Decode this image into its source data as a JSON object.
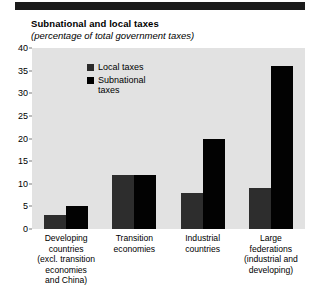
{
  "header": {
    "rule": "black-horizontal-rule"
  },
  "chart_data": {
    "type": "bar",
    "title": "Subnational and local taxes",
    "subtitle": "(percentage of  total government taxes)",
    "xlabel": "",
    "ylabel": "",
    "ylim": [
      0,
      40
    ],
    "yticks": [
      0,
      5,
      10,
      15,
      20,
      25,
      30,
      35,
      40
    ],
    "ytick_labels": [
      "0",
      "5",
      "10",
      "15",
      "20",
      "25",
      "30",
      "35",
      "40"
    ],
    "grid": false,
    "legend_position": "top-left-inside",
    "categories": [
      "Developing\ncountries\n(excl. transition\neconomies\nand China)",
      "Transition\neconomies",
      "Industrial\ncountries",
      "Large\nfederations\n(industrial and\ndeveloping)"
    ],
    "category_lines": [
      [
        "Developing",
        "countries",
        "(excl. transition",
        "economies",
        "and China)"
      ],
      [
        "Transition",
        "economies"
      ],
      [
        "Industrial",
        "countries"
      ],
      [
        "Large",
        "federations",
        "(industrial and",
        "developing)"
      ]
    ],
    "series": [
      {
        "name": "Local taxes",
        "color": "#2d2d2d",
        "values": [
          3,
          12,
          8,
          9
        ]
      },
      {
        "name": "Subnational taxes",
        "color": "#020202",
        "values": [
          5,
          12,
          20,
          36
        ]
      }
    ],
    "legend_entries": [
      {
        "label_line1": "Local taxes",
        "label_line2": ""
      },
      {
        "label_line1": "Subnational",
        "label_line2": "taxes"
      }
    ],
    "colors": {
      "plot_background": "#e2e2e2",
      "page_background": "#ffffff",
      "rule": "#1b1b1b",
      "text": "#000000"
    }
  }
}
